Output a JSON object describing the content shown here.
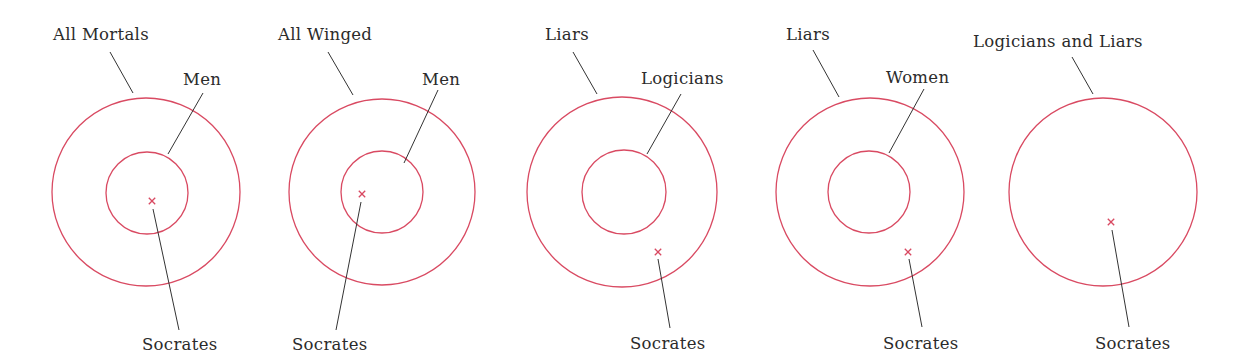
{
  "colors": {
    "circle": "#d94a62",
    "leader": "#333333",
    "text": "#2b2b2b",
    "background": "#ffffff"
  },
  "diagrams": [
    {
      "id": "d1",
      "outer_label": "All Mortals",
      "inner_label": "Men",
      "point_label": "Socrates",
      "outer": {
        "cx": 146,
        "cy": 192,
        "r": 94
      },
      "inner": {
        "cx": 147,
        "cy": 193,
        "r": 41
      },
      "point": {
        "x": 152,
        "y": 201
      },
      "outer_label_pos": {
        "x": 53,
        "y": 40
      },
      "outer_leader": [
        110,
        52,
        133,
        93
      ],
      "inner_label_pos": {
        "x": 183,
        "y": 85
      },
      "inner_leader": [
        203,
        93,
        168,
        154
      ],
      "point_label_pos": {
        "x": 142,
        "y": 350
      },
      "point_leader": [
        153,
        209,
        179,
        330
      ]
    },
    {
      "id": "d2",
      "outer_label": "All Winged",
      "inner_label": "Men",
      "point_label": "Socrates",
      "outer": {
        "cx": 382,
        "cy": 192,
        "r": 93
      },
      "inner": {
        "cx": 382,
        "cy": 192,
        "r": 41
      },
      "point": {
        "x": 362,
        "y": 194
      },
      "outer_label_pos": {
        "x": 278,
        "y": 40
      },
      "outer_leader": [
        328,
        52,
        353,
        95
      ],
      "inner_label_pos": {
        "x": 422,
        "y": 85
      },
      "inner_leader": [
        438,
        90,
        404,
        163
      ],
      "point_label_pos": {
        "x": 292,
        "y": 350
      },
      "point_leader": [
        361,
        202,
        336,
        330
      ]
    },
    {
      "id": "d3",
      "outer_label": "Liars",
      "inner_label": "Logicians",
      "point_label": "Socrates",
      "outer": {
        "cx": 622,
        "cy": 192,
        "r": 95
      },
      "inner": {
        "cx": 624,
        "cy": 192,
        "r": 42
      },
      "point": {
        "x": 658,
        "y": 252
      },
      "outer_label_pos": {
        "x": 545,
        "y": 40
      },
      "outer_leader": [
        573,
        52,
        597,
        94
      ],
      "inner_label_pos": {
        "x": 641,
        "y": 84
      },
      "inner_leader": [
        681,
        94,
        647,
        154
      ],
      "point_label_pos": {
        "x": 630,
        "y": 349
      },
      "point_leader": [
        658,
        259,
        670,
        328
      ]
    },
    {
      "id": "d4",
      "outer_label": "Liars",
      "inner_label": "Women",
      "point_label": "Socrates",
      "outer": {
        "cx": 870,
        "cy": 192,
        "r": 94
      },
      "inner": {
        "cx": 869,
        "cy": 192,
        "r": 41
      },
      "point": {
        "x": 908,
        "y": 252
      },
      "outer_label_pos": {
        "x": 786,
        "y": 40
      },
      "outer_leader": [
        813,
        50,
        839,
        97
      ],
      "inner_label_pos": {
        "x": 886,
        "y": 83
      },
      "inner_leader": [
        924,
        89,
        889,
        153
      ],
      "point_label_pos": {
        "x": 883,
        "y": 349
      },
      "point_leader": [
        909,
        259,
        922,
        327
      ]
    },
    {
      "id": "d5",
      "outer_label": "Logicians and Liars",
      "inner_label": null,
      "point_label": "Socrates",
      "outer": {
        "cx": 1103,
        "cy": 192,
        "r": 94
      },
      "inner": null,
      "point": {
        "x": 1111,
        "y": 222
      },
      "outer_label_pos": {
        "x": 973,
        "y": 47
      },
      "outer_leader": [
        1072,
        57,
        1093,
        94
      ],
      "point_label_pos": {
        "x": 1095,
        "y": 349
      },
      "point_leader": [
        1112,
        230,
        1129,
        327
      ]
    }
  ]
}
